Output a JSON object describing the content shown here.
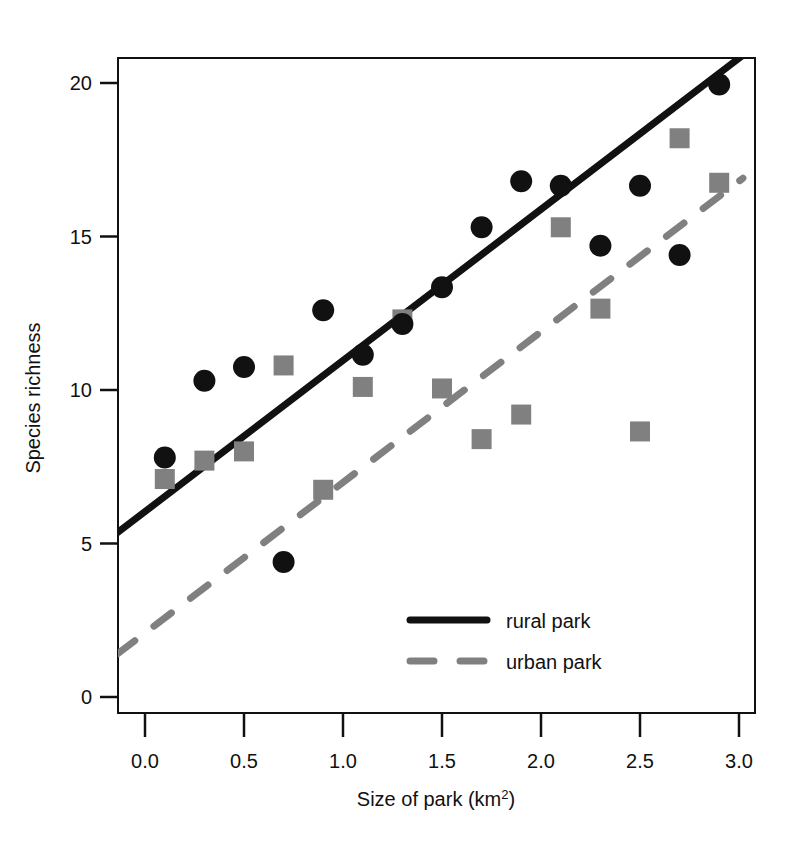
{
  "chart_data": {
    "type": "scatter",
    "title": "",
    "xlabel": "Size of park (km2)",
    "xlabel_base": "Size of park (km",
    "xlabel_sup": "2",
    "xlabel_close": ")",
    "ylabel": "Species richness",
    "xlim": [
      -0.14,
      3.1
    ],
    "ylim": [
      -0.6,
      21.3
    ],
    "xticks": [
      0.0,
      0.5,
      1.0,
      1.5,
      2.0,
      2.5,
      3.0
    ],
    "xticklabels": [
      "0.0",
      "0.5",
      "1.0",
      "1.5",
      "2.0",
      "2.5",
      "3.0"
    ],
    "yticks": [
      0,
      5,
      10,
      15,
      20
    ],
    "yticklabels": [
      "0",
      "5",
      "10",
      "15",
      "20"
    ],
    "grid": false,
    "legend_position": "bottom-right",
    "series": [
      {
        "name": "rural park",
        "marker": "circle",
        "color": "#111111",
        "line_style": "solid",
        "x": [
          0.1,
          0.3,
          0.5,
          0.7,
          0.9,
          1.1,
          1.3,
          1.5,
          1.7,
          1.9,
          2.1,
          2.3,
          2.5,
          2.7,
          2.9
        ],
        "y": [
          7.8,
          10.3,
          10.75,
          4.4,
          12.6,
          11.15,
          12.15,
          13.35,
          15.3,
          16.8,
          16.65,
          14.7,
          16.65,
          14.4,
          19.95
        ],
        "fit_line": {
          "x0": -0.14,
          "y0": 5.35,
          "x1": 3.1,
          "y1": 21.3
        }
      },
      {
        "name": "urban park",
        "marker": "square",
        "color": "#808080",
        "line_style": "dashed",
        "x": [
          0.1,
          0.3,
          0.5,
          0.7,
          0.9,
          1.1,
          1.3,
          1.5,
          1.7,
          1.9,
          2.1,
          2.3,
          2.5,
          2.7,
          2.9
        ],
        "y": [
          7.1,
          7.7,
          8.0,
          10.8,
          6.75,
          10.1,
          12.3,
          10.05,
          8.4,
          9.2,
          15.3,
          12.65,
          8.65,
          18.2,
          16.75
        ],
        "fit_line": {
          "x0": -0.14,
          "y0": 1.4,
          "x1": 3.02,
          "y1": 16.9
        }
      }
    ]
  },
  "legend": {
    "entries": [
      {
        "label": "rural park",
        "style": "solid",
        "color": "#111111"
      },
      {
        "label": "urban park",
        "style": "dashed",
        "color": "#808080"
      }
    ]
  },
  "colors": {
    "rural": "#111111",
    "urban": "#808080",
    "axis": "#111111",
    "background": "#ffffff"
  }
}
